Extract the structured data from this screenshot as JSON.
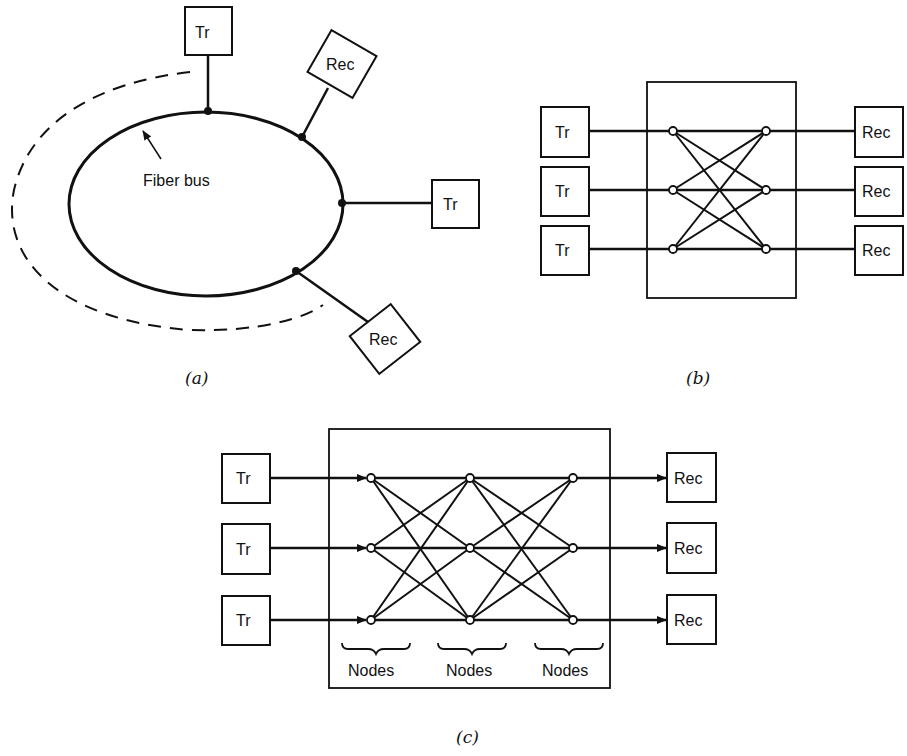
{
  "panel_a": {
    "caption": "(a)",
    "bus_label": "Fiber bus",
    "stations": [
      {
        "label": "Tr"
      },
      {
        "label": "Rec"
      },
      {
        "label": "Tr"
      },
      {
        "label": "Rec"
      }
    ]
  },
  "panel_b": {
    "caption": "(b)",
    "transmitters": [
      "Tr",
      "Tr",
      "Tr"
    ],
    "receivers": [
      "Rec",
      "Rec",
      "Rec"
    ]
  },
  "panel_c": {
    "caption": "(c)",
    "transmitters": [
      "Tr",
      "Tr",
      "Tr"
    ],
    "receivers": [
      "Rec",
      "Rec",
      "Rec"
    ],
    "node_groups": [
      "Nodes",
      "Nodes",
      "Nodes"
    ]
  }
}
